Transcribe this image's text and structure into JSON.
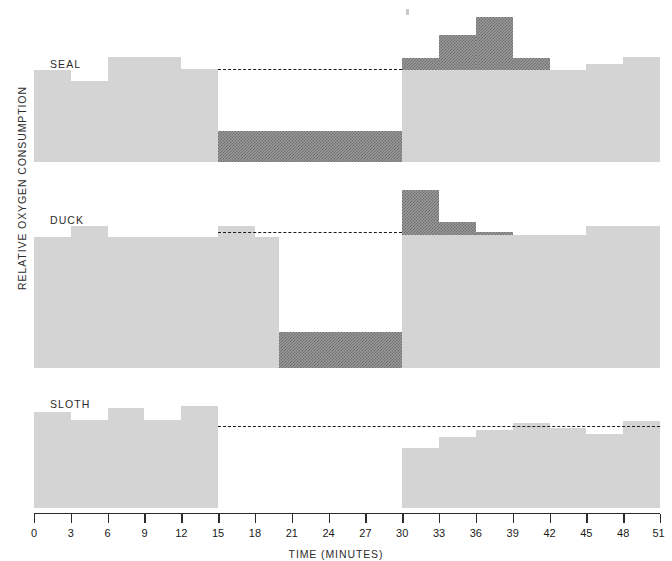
{
  "figure": {
    "y_axis_label": "RELATIVE OXYGEN CONSUMPTION",
    "x_axis_label": "TIME  (MINUTES)",
    "colors": {
      "baseline_fill": "#d4d4d4",
      "hatch_fill": "#6e6e6e",
      "axis": "#2b2b2b",
      "background": "#ffffff"
    }
  },
  "axis": {
    "x_min": 0,
    "x_max": 51,
    "tick_labels": [
      "0",
      "3",
      "6",
      "9",
      "12",
      "15",
      "18",
      "21",
      "24",
      "27",
      "30",
      "33",
      "36",
      "39",
      "42",
      "45",
      "48",
      "51"
    ],
    "tick_values": [
      0,
      3,
      6,
      9,
      12,
      15,
      18,
      21,
      24,
      27,
      30,
      33,
      36,
      39,
      42,
      45,
      48,
      51
    ]
  },
  "panels": [
    {
      "name": "SEAL",
      "title": "SEAL",
      "dive_start": 15,
      "dive_end": 30,
      "predive_label": "pre-dive",
      "reference_level": 62
    },
    {
      "name": "DUCK",
      "title": "DUCK",
      "dive_start": 15,
      "dive_end": 30,
      "predive_label": "pre-dive",
      "reference_level": 74
    },
    {
      "name": "SLOTH",
      "title": "SLOTH",
      "dive_start": 15,
      "dive_end": 30,
      "predive_label": "pre-dive",
      "reference_level": 72
    }
  ],
  "chart_data": {
    "type": "area",
    "xlabel": "TIME  (MINUTES)",
    "ylabel": "RELATIVE OXYGEN CONSUMPTION",
    "xlim": [
      0,
      51
    ],
    "ylim": [
      0,
      100
    ],
    "grid": false,
    "legend": "none",
    "series": [
      {
        "name": "SEAL",
        "steps": [
          {
            "x0": 0,
            "x1": 3,
            "value": 62,
            "fill": "baseline"
          },
          {
            "x0": 3,
            "x1": 6,
            "value": 55,
            "fill": "baseline"
          },
          {
            "x0": 6,
            "x1": 9,
            "value": 71,
            "fill": "baseline"
          },
          {
            "x0": 9,
            "x1": 12,
            "value": 71,
            "fill": "baseline"
          },
          {
            "x0": 12,
            "x1": 15,
            "value": 63,
            "fill": "baseline"
          },
          {
            "x0": 15,
            "x1": 30,
            "value": 21,
            "fill": "hatch"
          },
          {
            "x0": 30,
            "x1": 33,
            "value": 70,
            "fill": "hatch"
          },
          {
            "x0": 33,
            "x1": 36,
            "value": 86,
            "fill": "hatch"
          },
          {
            "x0": 36,
            "x1": 39,
            "value": 98,
            "fill": "hatch"
          },
          {
            "x0": 39,
            "x1": 42,
            "value": 70,
            "fill": "hatch"
          },
          {
            "x0": 30,
            "x1": 45,
            "value": 62,
            "fill": "baseline"
          },
          {
            "x0": 45,
            "x1": 48,
            "value": 66,
            "fill": "baseline"
          },
          {
            "x0": 48,
            "x1": 51,
            "value": 71,
            "fill": "baseline"
          }
        ]
      },
      {
        "name": "DUCK",
        "steps": [
          {
            "x0": 0,
            "x1": 3,
            "value": 72,
            "fill": "baseline"
          },
          {
            "x0": 3,
            "x1": 6,
            "value": 78,
            "fill": "baseline"
          },
          {
            "x0": 6,
            "x1": 15,
            "value": 72,
            "fill": "baseline"
          },
          {
            "x0": 15,
            "x1": 18,
            "value": 78,
            "fill": "baseline"
          },
          {
            "x0": 18,
            "x1": 20,
            "value": 72,
            "fill": "baseline"
          },
          {
            "x0": 20,
            "x1": 30,
            "value": 20,
            "fill": "hatch"
          },
          {
            "x0": 30,
            "x1": 33,
            "value": 98,
            "fill": "hatch"
          },
          {
            "x0": 33,
            "x1": 36,
            "value": 80,
            "fill": "hatch"
          },
          {
            "x0": 36,
            "x1": 39,
            "value": 75,
            "fill": "hatch"
          },
          {
            "x0": 30,
            "x1": 45,
            "value": 73,
            "fill": "baseline"
          },
          {
            "x0": 45,
            "x1": 48,
            "value": 78,
            "fill": "baseline"
          },
          {
            "x0": 48,
            "x1": 51,
            "value": 78,
            "fill": "baseline"
          }
        ]
      },
      {
        "name": "SLOTH",
        "steps": [
          {
            "x0": 0,
            "x1": 3,
            "value": 86,
            "fill": "baseline"
          },
          {
            "x0": 3,
            "x1": 6,
            "value": 79,
            "fill": "baseline"
          },
          {
            "x0": 6,
            "x1": 9,
            "value": 89,
            "fill": "baseline"
          },
          {
            "x0": 9,
            "x1": 12,
            "value": 79,
            "fill": "baseline"
          },
          {
            "x0": 12,
            "x1": 15,
            "value": 91,
            "fill": "baseline"
          },
          {
            "x0": 15,
            "x1": 30,
            "value": 0,
            "fill": "baseline"
          },
          {
            "x0": 30,
            "x1": 33,
            "value": 54,
            "fill": "baseline"
          },
          {
            "x0": 33,
            "x1": 36,
            "value": 63,
            "fill": "baseline"
          },
          {
            "x0": 36,
            "x1": 39,
            "value": 70,
            "fill": "baseline"
          },
          {
            "x0": 39,
            "x1": 42,
            "value": 76,
            "fill": "baseline"
          },
          {
            "x0": 42,
            "x1": 45,
            "value": 71,
            "fill": "baseline"
          },
          {
            "x0": 45,
            "x1": 48,
            "value": 66,
            "fill": "baseline"
          },
          {
            "x0": 48,
            "x1": 51,
            "value": 78,
            "fill": "baseline"
          }
        ]
      }
    ]
  }
}
